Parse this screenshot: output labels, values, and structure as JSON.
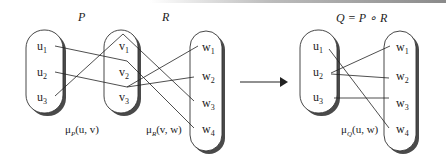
{
  "diagram": {
    "title_composition": "Q = P ∘ R",
    "relations": {
      "P": {
        "label": "P",
        "measure": "μ",
        "measure_sub": "P",
        "measure_args": "(u, v)"
      },
      "R": {
        "label": "R",
        "measure": "μ",
        "measure_sub": "R",
        "measure_args": "(v, w)"
      },
      "Q": {
        "label": "Q = P ∘ R",
        "measure": "μ",
        "measure_sub": "Q",
        "measure_args": "(u, w)"
      }
    },
    "sets": {
      "U_left": [
        {
          "base": "u",
          "sub": "1"
        },
        {
          "base": "u",
          "sub": "2"
        },
        {
          "base": "u",
          "sub": "3"
        }
      ],
      "V": [
        {
          "base": "v",
          "sub": "1"
        },
        {
          "base": "v",
          "sub": "2"
        },
        {
          "base": "v",
          "sub": "3"
        }
      ],
      "W_left": [
        {
          "base": "w",
          "sub": "1"
        },
        {
          "base": "w",
          "sub": "2"
        },
        {
          "base": "w",
          "sub": "3"
        },
        {
          "base": "w",
          "sub": "4"
        }
      ],
      "U_right": [
        {
          "base": "u",
          "sub": "1"
        },
        {
          "base": "u",
          "sub": "2"
        },
        {
          "base": "u",
          "sub": "3"
        }
      ],
      "W_right": [
        {
          "base": "w",
          "sub": "1"
        },
        {
          "base": "w",
          "sub": "2"
        },
        {
          "base": "w",
          "sub": "3"
        },
        {
          "base": "w",
          "sub": "4"
        }
      ]
    },
    "edges": {
      "P": [
        [
          "u1",
          "v2"
        ],
        [
          "u2",
          "v3"
        ],
        [
          "u3",
          "v1"
        ]
      ],
      "R": [
        [
          "v1",
          "w3"
        ],
        [
          "v2",
          "w4"
        ],
        [
          "v3",
          "w1"
        ],
        [
          "v3",
          "w2"
        ]
      ],
      "Q": [
        [
          "u1",
          "w4"
        ],
        [
          "u2",
          "w1"
        ],
        [
          "u2",
          "w2"
        ],
        [
          "u3",
          "w3"
        ]
      ]
    },
    "arrow": "right-arrow",
    "colors": {
      "stroke": "#222222",
      "shadow": "#555555",
      "fill": "#ffffff"
    }
  }
}
